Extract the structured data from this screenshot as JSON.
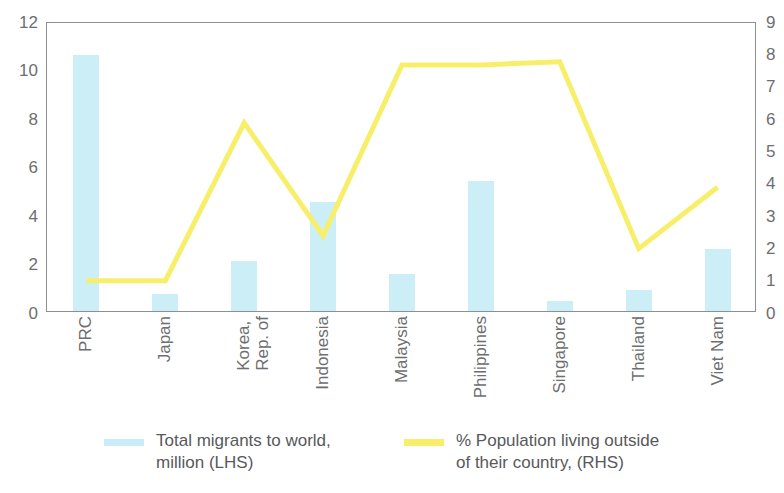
{
  "chart_data": {
    "type": "bar",
    "title": "",
    "subtitle": "",
    "xlabel": "",
    "categories": [
      "PRC",
      "Japan",
      "Korea,\nRep. of",
      "Indonesia",
      "Malaysia",
      "Philippines",
      "Singapore",
      "Thailand",
      "Viet Nam"
    ],
    "grid": false,
    "legend_position": "bottom",
    "axes": {
      "left": {
        "label": "Total migrants to world, million (LHS)",
        "min": 0,
        "max": 12,
        "step": 2,
        "ticks": [
          "0",
          "2",
          "4",
          "6",
          "8",
          "10",
          "12"
        ]
      },
      "right": {
        "label": "% Population living outside of their country, (RHS)",
        "min": 0,
        "max": 9,
        "step": 1,
        "ticks": [
          "0",
          "1",
          "2",
          "3",
          "4",
          "5",
          "6",
          "7",
          "8",
          "9"
        ]
      }
    },
    "series": [
      {
        "name": "Total migrants to world, million (LHS)",
        "type": "bar",
        "axis": "left",
        "color": "#c9edf7",
        "values": [
          10.6,
          0.7,
          2.05,
          4.5,
          1.55,
          5.4,
          0.4,
          0.85,
          2.55
        ]
      },
      {
        "name": "% Population living outside of their country, (RHS)",
        "type": "line",
        "axis": "right",
        "color": "#f7ef6a",
        "values": [
          1.0,
          1.0,
          5.9,
          2.4,
          7.7,
          7.7,
          7.8,
          2.0,
          3.9
        ]
      }
    ]
  },
  "legend": {
    "items": [
      {
        "label": "Total migrants to world,\nmillion (LHS)",
        "marker": "bar-swatch",
        "color": "#c9edf7"
      },
      {
        "label": "% Population living outside\nof their country, (RHS)",
        "marker": "line-swatch",
        "color": "#f7ef6a"
      }
    ]
  }
}
